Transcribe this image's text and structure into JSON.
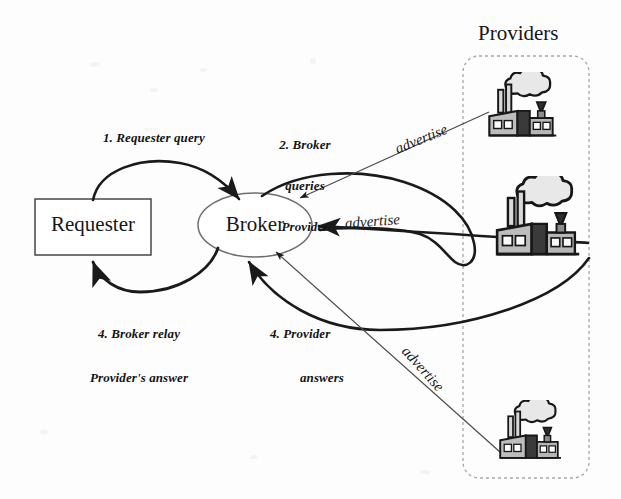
{
  "diagram": {
    "title_visible": false,
    "nodes": {
      "requester": {
        "label": "Requester",
        "shape": "rectangle"
      },
      "broker": {
        "label": "Broker",
        "shape": "ellipse"
      }
    },
    "group": {
      "label": "Providers",
      "shape": "rounded-rectangle-dashed",
      "members": [
        {
          "name": "provider-top",
          "icon": "factory-icon"
        },
        {
          "name": "provider-middle",
          "icon": "factory-icon"
        },
        {
          "name": "provider-bottom",
          "icon": "factory-icon"
        }
      ]
    },
    "edges": [
      {
        "id": "step1",
        "from": "requester",
        "to": "broker",
        "label": "1. Requester query"
      },
      {
        "id": "step2",
        "from": "broker",
        "to": "provider-top",
        "label_lines": [
          "2. Broker",
          "queries",
          "Provider"
        ]
      },
      {
        "id": "step4a",
        "from": "broker",
        "to": "requester",
        "label_lines": [
          "4. Broker relay",
          "Provider's answer"
        ]
      },
      {
        "id": "step4b",
        "from": "provider-bottom",
        "to": "broker",
        "label_lines": [
          "4. Provider",
          "answers"
        ]
      },
      {
        "id": "adv1",
        "from": "provider-top",
        "to": "broker",
        "label": "advertise"
      },
      {
        "id": "adv2",
        "from": "provider-middle",
        "to": "broker",
        "label": "advertise"
      },
      {
        "id": "adv3",
        "from": "provider-bottom",
        "to": "broker",
        "label": "advertise"
      }
    ],
    "labels": {
      "step1": "1. Requester query",
      "step2_line1": "2. Broker",
      "step2_line2": "queries",
      "step2_line3": "Provider",
      "step4a_line1": "4. Broker relay",
      "step4a_line2": "Provider's answer",
      "step4b_line1": "4. Provider",
      "step4b_line2": "answers",
      "advertise_top": "advertise",
      "advertise_middle": "advertise",
      "advertise_bottom": "advertise"
    },
    "colors": {
      "background": "#fdfdfd",
      "stroke": "#1a1a1a",
      "thin_stroke": "#555555",
      "group_border": "#9a9a9a",
      "text": "#141414"
    }
  }
}
